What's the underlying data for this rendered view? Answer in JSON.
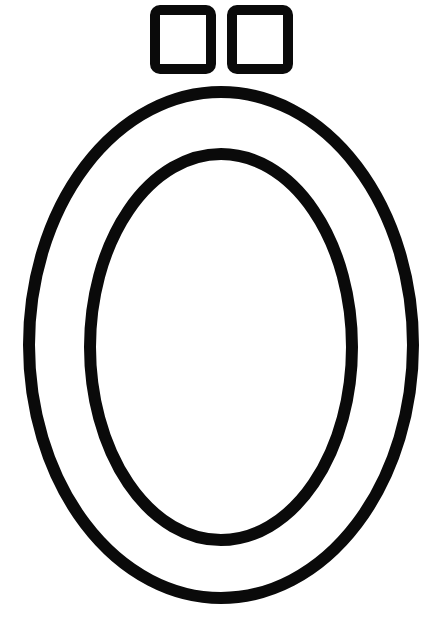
{
  "canvas": {
    "width": 444,
    "height": 621,
    "background_color": "#ffffff",
    "title": "Letter O outline coloring page"
  },
  "style": {
    "stroke_color": "#0a0a0a",
    "fill_color": "none",
    "stroke_width_oval_outer": 12,
    "stroke_width_oval_inner": 12,
    "stroke_width_square": 10,
    "line_cap": "round",
    "line_join": "round"
  },
  "shapes": {
    "square_left": {
      "name": "rounded-square-left",
      "x": 155,
      "y": 10,
      "width": 56,
      "height": 59,
      "corner_radius": 5
    },
    "square_right": {
      "name": "rounded-square-right",
      "x": 232,
      "y": 10,
      "width": 56,
      "height": 59,
      "corner_radius": 5
    },
    "oval_outer": {
      "name": "oval-outer",
      "center_x": 221,
      "center_y": 345,
      "radius_x": 192,
      "radius_y": 253
    },
    "oval_inner": {
      "name": "oval-inner",
      "center_x": 221,
      "center_y": 347,
      "radius_x": 131,
      "radius_y": 193
    }
  }
}
